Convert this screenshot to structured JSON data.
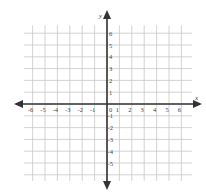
{
  "diagram": {
    "type": "coordinate-plane",
    "x_axis_label": "x",
    "y_axis_label": "y",
    "x_ticks": [
      "-6",
      "-5",
      "-4",
      "-3",
      "-2",
      "-1",
      "0",
      "1",
      "2",
      "3",
      "4",
      "5",
      "6"
    ],
    "y_ticks_positive": [
      "1",
      "2",
      "3",
      "4",
      "5",
      "6"
    ],
    "y_ticks_negative": [
      "-1",
      "-2",
      "-3",
      "-4",
      "-5"
    ],
    "x_range": [
      -7,
      7
    ],
    "y_range": [
      -6,
      7
    ],
    "grid": true
  },
  "colors": {
    "grid": "#c8c8c8",
    "axis": "#333333",
    "label": "#444444"
  }
}
